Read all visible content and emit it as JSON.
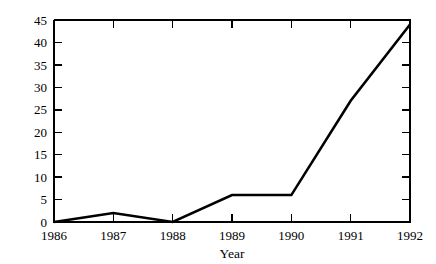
{
  "chart_data": {
    "type": "line",
    "title": "",
    "subtitle": "",
    "xlabel": "Year",
    "ylabel": "",
    "categories": [
      "1986",
      "1987",
      "1988",
      "1989",
      "1990",
      "1991",
      "1992"
    ],
    "x": [
      1986,
      1987,
      1988,
      1989,
      1990,
      1991,
      1992
    ],
    "values": [
      0,
      2,
      0,
      6,
      6,
      27,
      44
    ],
    "series": [
      {
        "name": "",
        "values": [
          0,
          2,
          0,
          6,
          6,
          27,
          44
        ]
      }
    ],
    "xlim": [
      1986,
      1992
    ],
    "ylim": [
      0,
      45
    ],
    "xticks": [
      "1986",
      "1987",
      "1988",
      "1989",
      "1990",
      "1991",
      "1992"
    ],
    "yticks": [
      "0",
      "5",
      "10",
      "15",
      "20",
      "25",
      "30",
      "35",
      "40",
      "45"
    ],
    "ytick_values": [
      0,
      5,
      10,
      15,
      20,
      25,
      30,
      35,
      40,
      45
    ],
    "grid": false,
    "legend": null,
    "legend_position": "none",
    "annotations": [],
    "line_color": "#000000",
    "background_color": "#ffffff",
    "axis_color": "#000000",
    "tick_direction": "in",
    "markers": false
  },
  "axes": {
    "x_title": "Year",
    "y_title": ""
  }
}
